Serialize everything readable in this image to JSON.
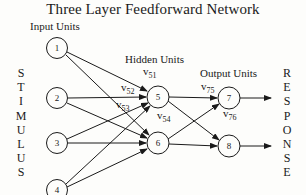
{
  "title": "Three Layer Feedforward Network",
  "layers": {
    "input_label": "Input Units",
    "hidden_label": "Hidden Units",
    "output_label": "Output Units"
  },
  "side_labels": {
    "left": [
      "S",
      "T",
      "I",
      "M",
      "U",
      "L",
      "U",
      "S"
    ],
    "right": [
      "R",
      "E",
      "S",
      "P",
      "O",
      "N",
      "S",
      "E"
    ],
    "left_word": "STIMULUS",
    "right_word": "RESPONSE"
  },
  "nodes": {
    "input": [
      "1",
      "2",
      "3",
      "4"
    ],
    "hidden": [
      "5",
      "6"
    ],
    "output": [
      "7",
      "8"
    ]
  },
  "weights": [
    {
      "v": "v",
      "sub": "51"
    },
    {
      "v": "v",
      "sub": "52"
    },
    {
      "v": "v",
      "sub": "53"
    },
    {
      "v": "v",
      "sub": "54"
    },
    {
      "v": "v",
      "sub": "75"
    },
    {
      "v": "v",
      "sub": "76"
    }
  ],
  "colors": {
    "ink": "#1a1a1a",
    "background": "#fdfdfb"
  }
}
